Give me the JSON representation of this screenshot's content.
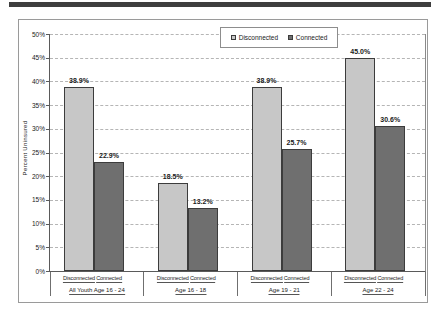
{
  "page": {
    "background_color": "#ffffff",
    "top_rule_color": "#3e3e3e"
  },
  "colors": {
    "disconnected_fill": "#c7c7c7",
    "connected_fill": "#6f6f6f",
    "bar_border": "#3c3c3c",
    "gridline": "#b5b5b5",
    "axis_line": "#5a5a5a",
    "frame_border": "#9a9a9a",
    "text": "#1a1a1a"
  },
  "chart_data": {
    "type": "bar",
    "title": "",
    "xlabel": "",
    "ylabel": "Percent Uninsured",
    "ylim": [
      0,
      50
    ],
    "ytick_step": 5,
    "ytick_labels": [
      "0%",
      "5%",
      "10%",
      "15%",
      "20%",
      "25%",
      "30%",
      "35%",
      "40%",
      "45%",
      "50%"
    ],
    "grid": "dashed-horizontal",
    "legend_position": "top-center",
    "categories": [
      "All Youth Age 16 - 24",
      "Age 16 - 18",
      "Age 19 - 21",
      "Age 22 - 24"
    ],
    "bar_sublabels": [
      "Disconnected",
      "Connected"
    ],
    "series": [
      {
        "name": "Disconnected",
        "color": "#c7c7c7",
        "values": [
          38.9,
          18.5,
          38.9,
          45.0
        ],
        "labels": [
          "38.9%",
          "18.5%",
          "38.9%",
          "45.0%"
        ]
      },
      {
        "name": "Connected",
        "color": "#6f6f6f",
        "values": [
          22.9,
          13.2,
          25.7,
          30.6
        ],
        "labels": [
          "22.9%",
          "13.2%",
          "25.7%",
          "30.6%"
        ]
      }
    ]
  }
}
